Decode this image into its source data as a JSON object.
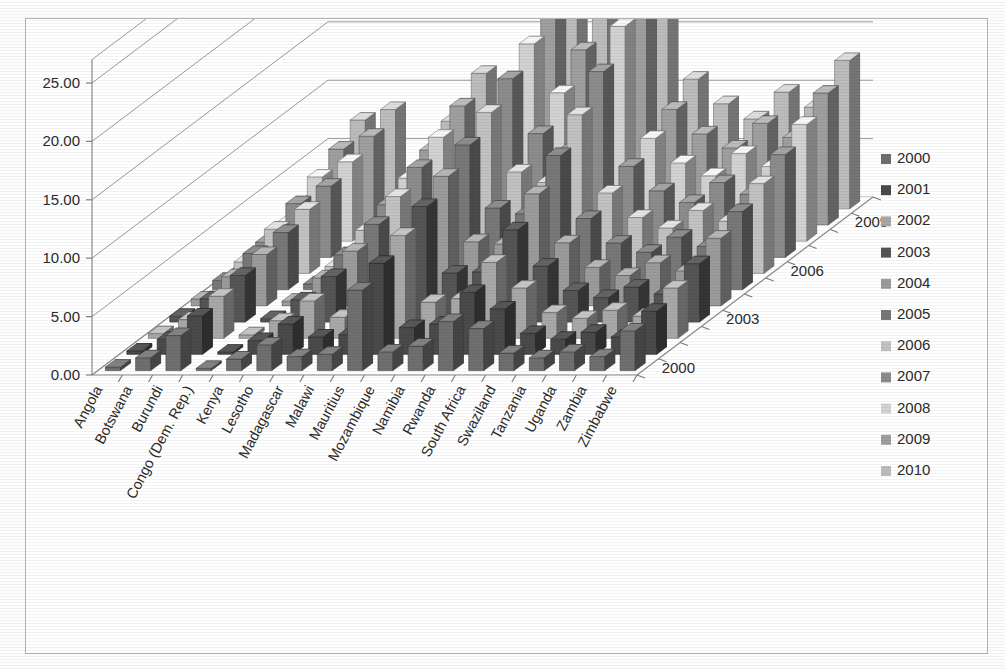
{
  "chart_data": {
    "type": "bar",
    "subtype": "3d-column-clustered",
    "title": "",
    "xlabel": "",
    "ylabel": "",
    "zlabel": "",
    "ylim": [
      0,
      25
    ],
    "ytick_values": [
      0,
      5,
      10,
      15,
      20,
      25
    ],
    "ytick_labels": [
      "0.00",
      "5.00",
      "10.00",
      "15.00",
      "20.00",
      "25.00"
    ],
    "grid": true,
    "legend_position": "right",
    "categories": [
      "Angola",
      "Botswana",
      "Burundi",
      "Congo (Dem. Rep.)",
      "Kenya",
      "Lesotho",
      "Madagascar",
      "Malawi",
      "Mauritius",
      "Mozambique",
      "Namibia",
      "Rwanda",
      "South Africa",
      "Swaziland",
      "Tanzania",
      "Uganda",
      "Zambia",
      "Zimbabwe"
    ],
    "depth_axis_labels": [
      "2000",
      "2003",
      "2006",
      "2009"
    ],
    "legend_entries": [
      "2000",
      "2001",
      "2002",
      "2003",
      "2004",
      "2005",
      "2006",
      "2007",
      "2008",
      "2009",
      "2010"
    ],
    "series": [
      {
        "name": "2000",
        "values": [
          0.3,
          1.1,
          3.0,
          0.2,
          1.0,
          2.2,
          1.2,
          1.4,
          6.9,
          1.6,
          2.1,
          4.2,
          3.6,
          1.5,
          1.1,
          1.6,
          1.2,
          3.4
        ]
      },
      {
        "name": "2001",
        "values": [
          0.3,
          1.3,
          3.3,
          0.2,
          1.2,
          2.6,
          1.5,
          1.7,
          7.8,
          2.3,
          2.6,
          5.3,
          3.9,
          1.8,
          1.3,
          1.9,
          1.5,
          3.7
        ]
      },
      {
        "name": "2002",
        "values": [
          0.4,
          1.6,
          3.6,
          0.3,
          1.5,
          3.2,
          1.8,
          2.1,
          8.8,
          3.1,
          3.4,
          6.5,
          4.3,
          2.2,
          1.7,
          2.4,
          1.9,
          4.3
        ]
      },
      {
        "name": "2003",
        "values": [
          0.5,
          2.0,
          4.0,
          0.3,
          1.9,
          3.9,
          2.2,
          2.6,
          9.9,
          4.2,
          4.3,
          7.9,
          4.8,
          2.7,
          2.1,
          3.0,
          2.4,
          5.0
        ]
      },
      {
        "name": "2004",
        "values": [
          0.6,
          2.5,
          4.4,
          0.4,
          2.4,
          4.7,
          2.7,
          3.2,
          11.1,
          5.5,
          5.3,
          9.6,
          5.4,
          3.3,
          2.6,
          3.7,
          3.0,
          5.8
        ]
      },
      {
        "name": "2005",
        "values": [
          0.8,
          3.1,
          4.9,
          0.5,
          3.0,
          5.6,
          3.3,
          3.9,
          12.4,
          7.0,
          6.5,
          11.5,
          6.1,
          4.0,
          3.2,
          4.5,
          3.7,
          6.7
        ]
      },
      {
        "name": "2006",
        "values": [
          1.0,
          3.8,
          5.5,
          0.6,
          3.7,
          6.6,
          4.0,
          4.7,
          13.8,
          8.7,
          7.8,
          13.6,
          6.9,
          4.8,
          3.9,
          5.4,
          4.5,
          7.7
        ]
      },
      {
        "name": "2007",
        "values": [
          1.3,
          4.6,
          6.1,
          0.7,
          4.5,
          7.7,
          4.8,
          5.6,
          15.3,
          10.6,
          9.2,
          15.9,
          7.8,
          5.7,
          4.7,
          6.4,
          5.4,
          8.8
        ]
      },
      {
        "name": "2008",
        "values": [
          1.6,
          5.5,
          6.8,
          0.9,
          5.4,
          8.9,
          5.7,
          6.6,
          16.9,
          12.7,
          10.7,
          18.4,
          8.8,
          6.7,
          5.6,
          7.5,
          6.4,
          10.0
        ]
      },
      {
        "name": "2009",
        "values": [
          2.0,
          6.5,
          7.6,
          1.1,
          6.4,
          10.2,
          6.7,
          7.7,
          23.4,
          15.0,
          12.3,
          21.1,
          9.9,
          7.8,
          6.6,
          8.7,
          7.5,
          11.3
        ]
      },
      {
        "name": "2010",
        "values": [
          2.4,
          7.6,
          8.5,
          1.3,
          7.5,
          11.6,
          7.8,
          8.9,
          24.6,
          17.5,
          14.0,
          24.0,
          11.1,
          9.0,
          7.7,
          10.0,
          8.7,
          12.7
        ]
      }
    ],
    "series_colors": [
      "#6f6f6f",
      "#4a4a4a",
      "#a8a8a8",
      "#555555",
      "#9b9b9b",
      "#787878",
      "#c2c2c2",
      "#8c8c8c",
      "#d2d2d2",
      "#9f9f9f",
      "#bcbcbc"
    ]
  },
  "legend": {
    "marker_shape": "square",
    "items": [
      {
        "label": "2000",
        "color": "#6f6f6f"
      },
      {
        "label": "2001",
        "color": "#4a4a4a"
      },
      {
        "label": "2002",
        "color": "#a8a8a8"
      },
      {
        "label": "2003",
        "color": "#555555"
      },
      {
        "label": "2004",
        "color": "#9b9b9b"
      },
      {
        "label": "2005",
        "color": "#787878"
      },
      {
        "label": "2006",
        "color": "#c2c2c2"
      },
      {
        "label": "2007",
        "color": "#8c8c8c"
      },
      {
        "label": "2008",
        "color": "#d2d2d2"
      },
      {
        "label": "2009",
        "color": "#9f9f9f"
      },
      {
        "label": "2010",
        "color": "#bcbcbc"
      }
    ]
  },
  "style": {
    "border_color": "#b4b4b4",
    "plot_background": "#ffffff",
    "grid_color": "#9a9a9a",
    "axis_color": "#8a8a8a",
    "text_color": "#2b2b2b"
  }
}
